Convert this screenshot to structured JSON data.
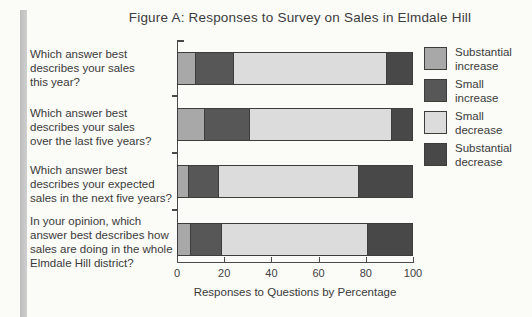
{
  "chart_data": {
    "type": "bar",
    "orientation": "horizontal",
    "stacked": true,
    "title": "Figure A: Responses to Survey on Sales in Elmdale Hill",
    "xlabel": "Responses to Questions by Percentage",
    "xlim": [
      0,
      100
    ],
    "x_ticks": [
      0,
      20,
      40,
      60,
      80,
      100
    ],
    "grid": false,
    "legend_position": "right",
    "categories": [
      "Which answer best\ndescribes your sales\nthis year?",
      "Which answer best\ndescribes your sales\nover the last five years?",
      "Which answer best\ndescribes your expected\nsales in the next five years?",
      "In your opinion, which\nanswer best describes how\nsales are doing in the whole\nElmdale Hill district?"
    ],
    "series": [
      {
        "name": "Substantial increase",
        "color": "#a8a8a8",
        "values": [
          8,
          12,
          5,
          6
        ]
      },
      {
        "name": "Small increase",
        "color": "#575757",
        "values": [
          16,
          19,
          13,
          13
        ]
      },
      {
        "name": "Small decrease",
        "color": "#dcdcdc",
        "values": [
          65,
          60,
          59,
          62
        ]
      },
      {
        "name": "Substantial decrease",
        "color": "#484848",
        "values": [
          11,
          9,
          23,
          19
        ]
      }
    ],
    "legend": [
      {
        "label": "Substantial\nincrease",
        "color": "#a8a8a8"
      },
      {
        "label": "Small\nincrease",
        "color": "#575757"
      },
      {
        "label": "Small\ndecrease",
        "color": "#dcdcdc"
      },
      {
        "label": "Substantial\ndecrease",
        "color": "#484848"
      }
    ],
    "colors": {
      "axis": "#4a4a4a",
      "text": "#3a3a3a",
      "paper": "#fbfbf8"
    }
  }
}
